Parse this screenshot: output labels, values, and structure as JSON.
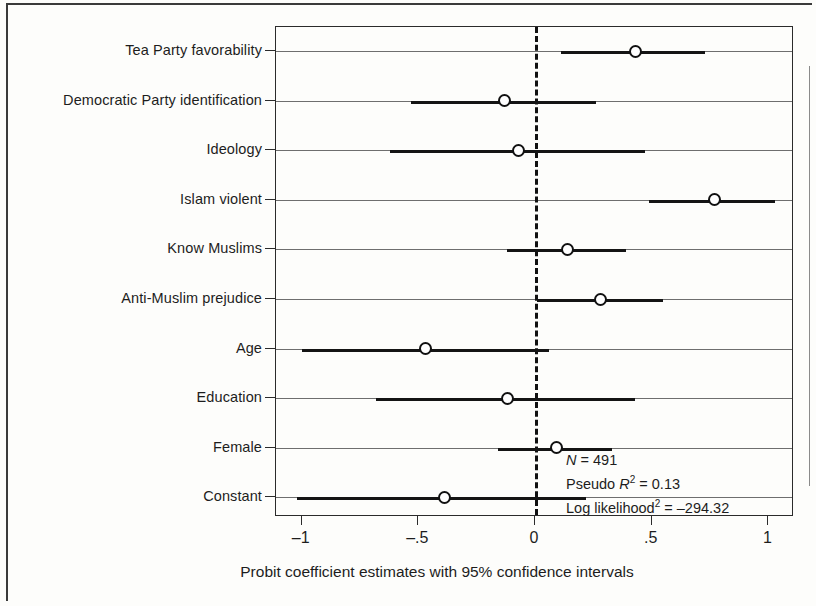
{
  "chart_data": {
    "type": "scatter",
    "subtype": "coefficient-plot",
    "title": "",
    "xlabel": "Probit coefficient estimates with 95% confidence intervals",
    "ylabel": "",
    "xlim": [
      -1.11,
      1.11
    ],
    "xticks": [
      -1,
      -0.5,
      0,
      0.5,
      1
    ],
    "xticklabels": [
      "–1",
      "–.5",
      "0",
      ".5",
      "1"
    ],
    "grid": "horizontal",
    "reference_line": {
      "x": 0,
      "style": "dashed"
    },
    "legend": "none",
    "marker": "open-circle",
    "categories": [
      "Tea Party favorability",
      "Democratic Party identification",
      "Ideology",
      "Islam violent",
      "Know Muslims",
      "Anti-Muslim prejudice",
      "Age",
      "Education",
      "Female",
      "Constant"
    ],
    "estimates": [
      0.43,
      -0.13,
      -0.07,
      0.77,
      0.14,
      0.28,
      -0.47,
      -0.12,
      0.09,
      -0.39
    ],
    "ci_low": [
      0.11,
      -0.53,
      -0.62,
      0.49,
      -0.12,
      0.01,
      -1.0,
      -0.68,
      -0.16,
      -1.02
    ],
    "ci_high": [
      0.73,
      0.26,
      0.47,
      1.03,
      0.39,
      0.55,
      0.06,
      0.43,
      0.33,
      0.22
    ],
    "points": [
      {
        "label": "Tea Party favorability",
        "estimate": 0.43,
        "ci_low": 0.11,
        "ci_high": 0.73
      },
      {
        "label": "Democratic Party identification",
        "estimate": -0.13,
        "ci_low": -0.53,
        "ci_high": 0.26
      },
      {
        "label": "Ideology",
        "estimate": -0.07,
        "ci_low": -0.62,
        "ci_high": 0.47
      },
      {
        "label": "Islam violent",
        "estimate": 0.77,
        "ci_low": 0.49,
        "ci_high": 1.03
      },
      {
        "label": "Know Muslims",
        "estimate": 0.14,
        "ci_low": -0.12,
        "ci_high": 0.39
      },
      {
        "label": "Anti-Muslim prejudice",
        "estimate": 0.28,
        "ci_low": 0.01,
        "ci_high": 0.55
      },
      {
        "label": "Age",
        "estimate": -0.47,
        "ci_low": -1.0,
        "ci_high": 0.06
      },
      {
        "label": "Education",
        "estimate": -0.12,
        "ci_low": -0.68,
        "ci_high": 0.43
      },
      {
        "label": "Female",
        "estimate": 0.09,
        "ci_low": -0.16,
        "ci_high": 0.33
      },
      {
        "label": "Constant",
        "estimate": -0.39,
        "ci_low": -1.02,
        "ci_high": 0.22
      }
    ],
    "annotations": {
      "n_label": "N",
      "n_value": "= 491",
      "pseudo_r2_label": "Pseudo R",
      "pseudo_r2_sup": "2",
      "pseudo_r2_value": "= 0.13",
      "loglik_label": "Log likelihood",
      "loglik_sup": "2",
      "loglik_value": "= –294.32"
    },
    "colors": {
      "ink": "#141414",
      "gridline": "#6e6e6e",
      "background": "#fdfdfb"
    }
  }
}
